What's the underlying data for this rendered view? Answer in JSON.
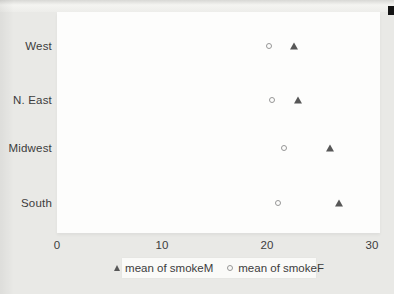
{
  "page": {
    "background_color": "#e9e9e6",
    "plot_background_color": "#fdfdfc"
  },
  "chart_data": {
    "type": "scatter",
    "subtype": "horizontal-dot-plot",
    "title": "",
    "xlabel": "",
    "ylabel": "",
    "categories": [
      "West",
      "N. East",
      "Midwest",
      "South"
    ],
    "series": [
      {
        "name": "mean of smokeM",
        "marker": "filled-triangle",
        "color": "#575757",
        "values": [
          22.6,
          23.0,
          26.0,
          26.9
        ]
      },
      {
        "name": "mean of smokeF",
        "marker": "open-circle",
        "color": "#979797",
        "values": [
          20.2,
          20.5,
          21.6,
          21.1
        ]
      }
    ],
    "x_ticks": [
      0,
      10,
      20,
      30
    ],
    "x_tick_labels": [
      "0",
      "10",
      "20",
      "30"
    ],
    "xlim": [
      0,
      30.8
    ],
    "grid": false,
    "legend_position": "bottom-center"
  }
}
